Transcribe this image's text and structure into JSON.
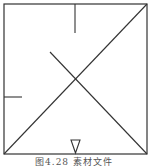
{
  "figure": {
    "caption": "图4.28  素材文件",
    "stroke_color": "#333333",
    "background": "#ffffff"
  },
  "diagram": {
    "square": {
      "x1": 4,
      "y1": 4,
      "x2": 147,
      "y2": 154
    },
    "elements": [
      {
        "name": "full-diagonal",
        "type": "line",
        "from": [
          4,
          154
        ],
        "to": [
          147,
          4
        ]
      },
      {
        "name": "partial-diagonal",
        "type": "line",
        "from": [
          50,
          52
        ],
        "to": [
          147,
          154
        ]
      },
      {
        "name": "top-tick",
        "type": "line",
        "from": [
          75,
          4
        ],
        "to": [
          75,
          33
        ]
      },
      {
        "name": "left-tick",
        "type": "line",
        "from": [
          4,
          97
        ],
        "to": [
          22,
          97
        ]
      },
      {
        "name": "bottom-triangle-marker",
        "type": "triangle",
        "points": [
          [
            71,
            140
          ],
          [
            80,
            140
          ],
          [
            75.5,
            153
          ]
        ]
      }
    ]
  }
}
